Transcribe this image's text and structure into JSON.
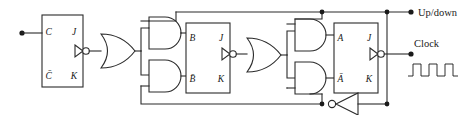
{
  "diagram": {
    "type": "logic-circuit-schematic",
    "ink_color": "#2b2b2b",
    "background": "#ffffff",
    "signals": {
      "up_down_label": "Up/down",
      "clock_label": "Clock"
    },
    "flipflops": [
      {
        "id": "ff-c",
        "pins": {
          "top_left": "C",
          "top_right": "J",
          "bottom_left": "C̄",
          "bottom_right": "K"
        },
        "clock_input": "edge-triggered-inverted"
      },
      {
        "id": "ff-b",
        "pins": {
          "top_left": "B",
          "top_right": "J",
          "bottom_left": "B̄",
          "bottom_right": "K"
        },
        "clock_input": "edge-triggered-inverted"
      },
      {
        "id": "ff-a",
        "pins": {
          "top_left": "A",
          "top_right": "J",
          "bottom_left": "Ā",
          "bottom_right": "K"
        },
        "clock_input": "edge-triggered-inverted"
      }
    ],
    "gates": [
      {
        "id": "or-1",
        "kind": "or",
        "inputs": 2
      },
      {
        "id": "and-1-top",
        "kind": "and",
        "inputs": 2
      },
      {
        "id": "and-1-bottom",
        "kind": "and",
        "inputs": 2
      },
      {
        "id": "or-2",
        "kind": "or",
        "inputs": 2
      },
      {
        "id": "and-2-top",
        "kind": "and",
        "inputs": 2
      },
      {
        "id": "and-2-bottom",
        "kind": "and",
        "inputs": 2
      },
      {
        "id": "inverter-1",
        "kind": "not",
        "inputs": 1
      }
    ],
    "clock_waveform": {
      "pulses": 3,
      "shape": "square"
    },
    "terminals": [
      {
        "id": "input-terminal-c",
        "kind": "filled-dot"
      },
      {
        "id": "up-down-terminal",
        "kind": "filled-dot"
      },
      {
        "id": "clock-terminal",
        "kind": "filled-dot"
      }
    ],
    "junctions": 5
  }
}
